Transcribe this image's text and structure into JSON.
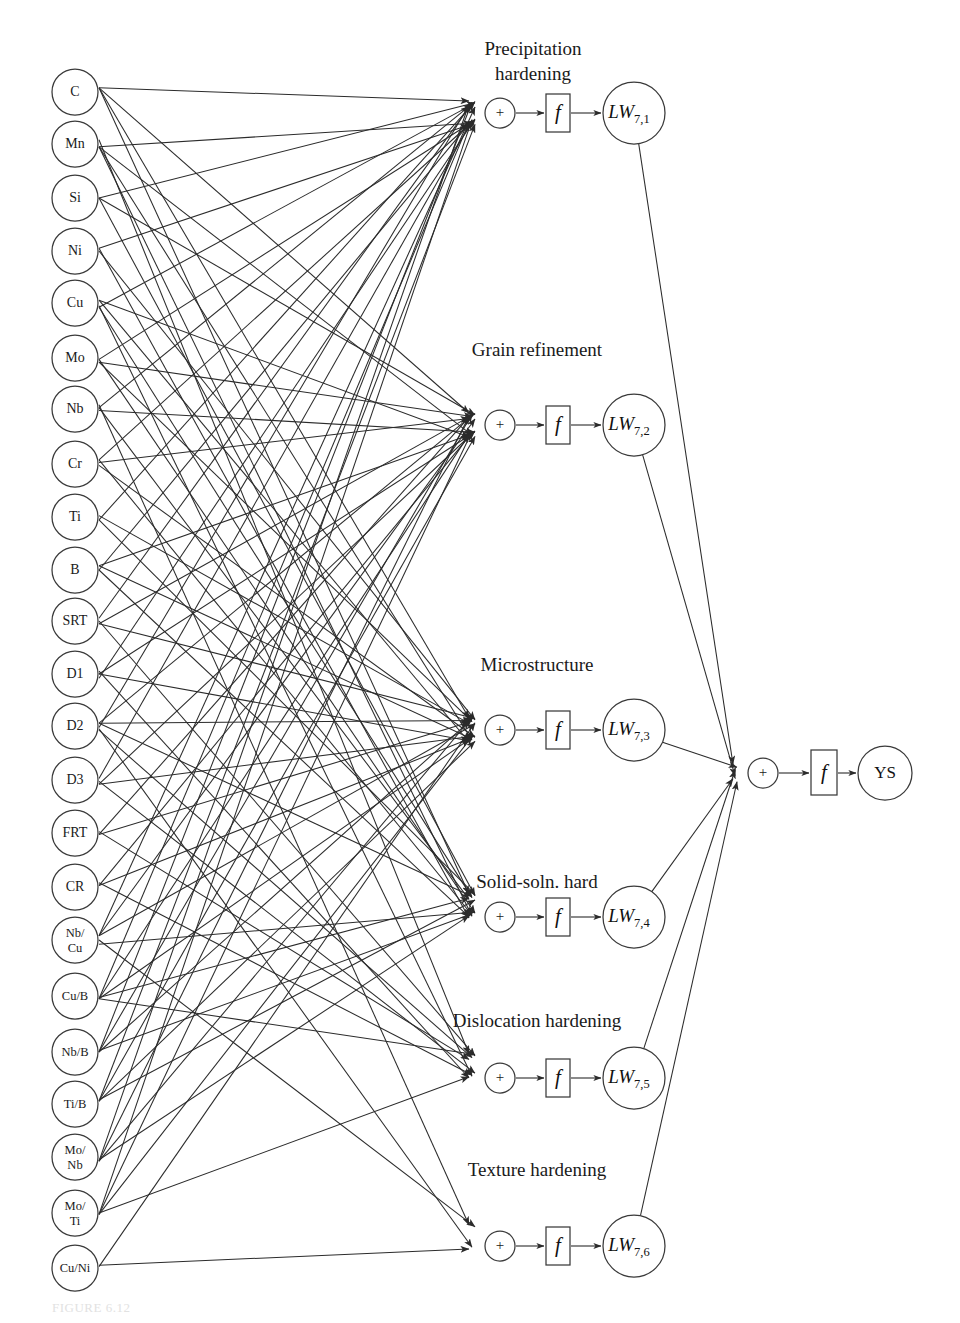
{
  "figure": {
    "caption_faint": "FIGURE 6.12",
    "background_color": "#ffffff",
    "line_color": "#2b2b2b",
    "node_stroke_color": "#3a3a3a"
  },
  "input_layer": {
    "name": "input-variables",
    "count": 23,
    "nodes": [
      {
        "label": "C",
        "lines": [
          "C"
        ],
        "cy": 92
      },
      {
        "label": "Mn",
        "lines": [
          "Mn"
        ],
        "cy": 144
      },
      {
        "label": "Si",
        "lines": [
          "Si"
        ],
        "cy": 198
      },
      {
        "label": "Ni",
        "lines": [
          "Ni"
        ],
        "cy": 251
      },
      {
        "label": "Cu",
        "lines": [
          "Cu"
        ],
        "cy": 303
      },
      {
        "label": "Mo",
        "lines": [
          "Mo"
        ],
        "cy": 358
      },
      {
        "label": "Nb",
        "lines": [
          "Nb"
        ],
        "cy": 409
      },
      {
        "label": "Cr",
        "lines": [
          "Cr"
        ],
        "cy": 464
      },
      {
        "label": "Ti",
        "lines": [
          "Ti"
        ],
        "cy": 517
      },
      {
        "label": "B",
        "lines": [
          "B"
        ],
        "cy": 570
      },
      {
        "label": "SRT",
        "lines": [
          "SRT"
        ],
        "cy": 621
      },
      {
        "label": "D1",
        "lines": [
          "D1"
        ],
        "cy": 674
      },
      {
        "label": "D2",
        "lines": [
          "D2"
        ],
        "cy": 726
      },
      {
        "label": "D3",
        "lines": [
          "D3"
        ],
        "cy": 780
      },
      {
        "label": "FRT",
        "lines": [
          "FRT"
        ],
        "cy": 833
      },
      {
        "label": "CR",
        "lines": [
          "CR"
        ],
        "cy": 887
      },
      {
        "label": "Nb/Cu",
        "lines": [
          "Nb/",
          "Cu"
        ],
        "cy": 940
      },
      {
        "label": "Cu/B",
        "lines": [
          "Cu/B"
        ],
        "cy": 996
      },
      {
        "label": "Nb/B",
        "lines": [
          "Nb/B"
        ],
        "cy": 1052
      },
      {
        "label": "Ti/B",
        "lines": [
          "Ti/B"
        ],
        "cy": 1104
      },
      {
        "label": "Mo/Nb",
        "lines": [
          "Mo/",
          "Nb"
        ],
        "cy": 1157
      },
      {
        "label": "Mo/Ti",
        "lines": [
          "Mo/",
          "Ti"
        ],
        "cy": 1213
      },
      {
        "label": "Cu/Ni",
        "lines": [
          "Cu/Ni"
        ],
        "cy": 1268
      }
    ],
    "cx": 75,
    "radius": 23
  },
  "hidden_layer": {
    "name": "hidden-neurons",
    "count": 6,
    "sum_symbol": "+",
    "transfer_symbol": "f",
    "neurons": [
      {
        "label": "Precipitation hardening",
        "label_lines": [
          "Precipitation",
          "hardening"
        ],
        "weight_label": "LW",
        "weight_sub": "7,1",
        "cy": 113,
        "label_y": 55,
        "converge_x": 472,
        "converge_y": 113
      },
      {
        "label": "Grain refinement",
        "label_lines": [
          "Grain refinement"
        ],
        "weight_label": "LW",
        "weight_sub": "7,2",
        "cy": 425,
        "label_y": 356,
        "converge_x": 472,
        "converge_y": 425
      },
      {
        "label": "Microstructure",
        "label_lines": [
          "Microstructure"
        ],
        "weight_label": "LW",
        "weight_sub": "7,3",
        "cy": 730,
        "label_y": 671,
        "converge_x": 472,
        "converge_y": 730
      },
      {
        "label": "Solid-soln. hard",
        "label_lines": [
          "Solid-soln. hard"
        ],
        "weight_label": "LW",
        "weight_sub": "7,4",
        "cy": 917,
        "label_y": 888,
        "converge_x": 472,
        "converge_y": 906
      },
      {
        "label": "Dislocation hardening",
        "label_lines": [
          "Dislocation hardening"
        ],
        "weight_label": "LW",
        "weight_sub": "7,5",
        "cy": 1078,
        "label_y": 1027,
        "converge_x": 472,
        "converge_y": 1066
      },
      {
        "label": "Texture hardening",
        "label_lines": [
          "Texture hardening"
        ],
        "weight_label": "LW",
        "weight_sub": "7,6",
        "cy": 1246,
        "label_y": 1176,
        "converge_x": 472,
        "converge_y": 1237
      }
    ],
    "sum_cx": 500,
    "sum_r": 15,
    "fbox_x": 546,
    "fbox_w": 24,
    "fbox_h": 38,
    "lw_cx": 634,
    "lw_r": 31
  },
  "output_layer": {
    "name": "output-yield-strength",
    "sum_symbol": "+",
    "transfer_symbol": "f",
    "output_label": "YS",
    "sum_cx": 763,
    "sum_cy": 773,
    "sum_r": 15,
    "fbox_x": 811,
    "fbox_y": 750,
    "fbox_w": 26,
    "fbox_h": 45,
    "out_cx": 885,
    "out_cy": 773,
    "out_r": 27,
    "converge_x": 735,
    "converge_y": 773
  },
  "connections": {
    "description": "Fully-fanned weighted connections from the 23 input variables to the 6 hidden summation nodes, then from each LW node to the output summation node.",
    "input_to_hidden": [
      {
        "target": 0,
        "sources": [
          0,
          1,
          2,
          3,
          4,
          5,
          6,
          7,
          8,
          9,
          10,
          11,
          12,
          13,
          16,
          17,
          18,
          19,
          20,
          21
        ]
      },
      {
        "target": 1,
        "sources": [
          0,
          1,
          2,
          4,
          5,
          6,
          7,
          9,
          10,
          11,
          12,
          13,
          14,
          15,
          16,
          17,
          18,
          19,
          20,
          21
        ]
      },
      {
        "target": 2,
        "sources": [
          0,
          1,
          3,
          4,
          5,
          7,
          8,
          9,
          10,
          11,
          12,
          13,
          14,
          15,
          16,
          17,
          18,
          19,
          20,
          21,
          22
        ]
      },
      {
        "target": 3,
        "sources": [
          0,
          1,
          2,
          3,
          4,
          5,
          6,
          7,
          8,
          9,
          12,
          16,
          17,
          18,
          19,
          20
        ]
      },
      {
        "target": 4,
        "sources": [
          1,
          4,
          10,
          11,
          12,
          13,
          14,
          15,
          17,
          21
        ]
      },
      {
        "target": 5,
        "sources": [
          6,
          12,
          16,
          22
        ]
      }
    ],
    "hidden_to_output": [
      0,
      1,
      2,
      3,
      4,
      5
    ]
  }
}
